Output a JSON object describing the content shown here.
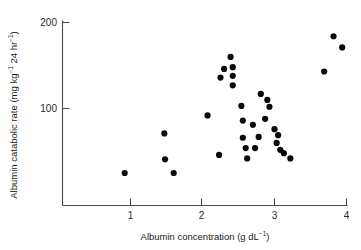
{
  "chart_data": {
    "type": "scatter",
    "title": "",
    "xlabel": "Albumin concentration (g dL⁻¹)",
    "ylabel": "Albumin catabolic rate (mg kg⁻¹ 24 hr⁻¹)",
    "xlim": [
      0.05,
      4.03
    ],
    "ylim": [
      0.0,
      207.0
    ],
    "xticks": [
      1,
      2,
      3,
      4
    ],
    "xtick_labels": [
      "1",
      "2",
      "3",
      "4"
    ],
    "yticks": [
      100,
      200
    ],
    "ytick_labels": [
      "100",
      "200"
    ],
    "grid": false,
    "legend": null,
    "marker": "filled-circle",
    "marker_color": "#0a0a0a",
    "n_points": 33,
    "points": [
      {
        "x": 0.92,
        "y": 25
      },
      {
        "x": 1.47,
        "y": 71
      },
      {
        "x": 1.48,
        "y": 41
      },
      {
        "x": 1.6,
        "y": 25
      },
      {
        "x": 2.07,
        "y": 92
      },
      {
        "x": 2.23,
        "y": 46
      },
      {
        "x": 2.25,
        "y": 136
      },
      {
        "x": 2.3,
        "y": 146
      },
      {
        "x": 2.39,
        "y": 160
      },
      {
        "x": 2.42,
        "y": 148
      },
      {
        "x": 2.42,
        "y": 138
      },
      {
        "x": 2.42,
        "y": 127
      },
      {
        "x": 2.54,
        "y": 103
      },
      {
        "x": 2.56,
        "y": 86
      },
      {
        "x": 2.56,
        "y": 66
      },
      {
        "x": 2.6,
        "y": 54
      },
      {
        "x": 2.62,
        "y": 42
      },
      {
        "x": 2.7,
        "y": 81
      },
      {
        "x": 2.73,
        "y": 54
      },
      {
        "x": 2.78,
        "y": 67
      },
      {
        "x": 2.81,
        "y": 117
      },
      {
        "x": 2.87,
        "y": 88
      },
      {
        "x": 2.9,
        "y": 110
      },
      {
        "x": 2.93,
        "y": 102
      },
      {
        "x": 3.0,
        "y": 76
      },
      {
        "x": 3.03,
        "y": 60
      },
      {
        "x": 3.05,
        "y": 69
      },
      {
        "x": 3.08,
        "y": 52
      },
      {
        "x": 3.13,
        "y": 48
      },
      {
        "x": 3.22,
        "y": 42
      },
      {
        "x": 3.69,
        "y": 143
      },
      {
        "x": 3.82,
        "y": 184
      },
      {
        "x": 3.94,
        "y": 171
      }
    ]
  },
  "axes": {
    "x_title_main": "Albumin concentration (g dL",
    "x_title_sup": "−1",
    "x_title_end": ")",
    "y_title_p1": "Albumin catabolic rate (mg kg",
    "y_title_s1": "−1",
    "y_title_p2": " 24 hr",
    "y_title_s2": "−1",
    "y_title_p3": ")"
  }
}
